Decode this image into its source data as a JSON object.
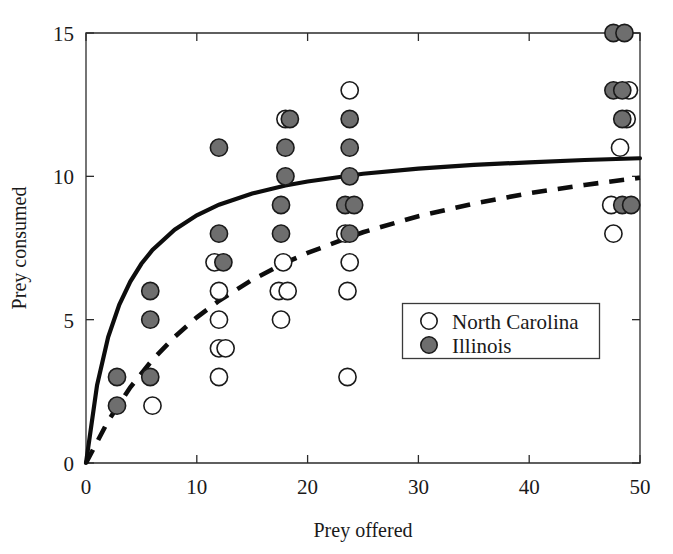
{
  "chart_data": {
    "type": "scatter",
    "title": "",
    "xlabel": "Prey offered",
    "ylabel": "Prey consumed",
    "xlim": [
      0,
      50
    ],
    "ylim": [
      0,
      15
    ],
    "xticks": [
      0,
      10,
      20,
      30,
      40,
      50
    ],
    "yticks": [
      0,
      5,
      10,
      15
    ],
    "xtick_labels": [
      "0",
      "10",
      "20",
      "30",
      "40",
      "50"
    ],
    "ytick_labels": [
      "0",
      "5",
      "10",
      "15"
    ],
    "grid": false,
    "legend_position": "lower-right-inside",
    "series": [
      {
        "name": "North Carolina",
        "marker": "open-circle",
        "marker_fill": "#ffffff",
        "marker_edge": "#1a1a1a",
        "fit_line_style": "dashed",
        "points": [
          [
            6,
            2
          ],
          [
            12,
            3
          ],
          [
            12,
            4
          ],
          [
            12.6,
            4
          ],
          [
            12,
            5
          ],
          [
            12,
            6
          ],
          [
            11.6,
            7
          ],
          [
            17.6,
            5
          ],
          [
            17.4,
            6
          ],
          [
            18.2,
            6
          ],
          [
            17.8,
            7
          ],
          [
            18,
            12
          ],
          [
            23.6,
            3
          ],
          [
            23.6,
            6
          ],
          [
            23.8,
            7
          ],
          [
            23.4,
            8
          ],
          [
            23.8,
            13
          ],
          [
            47.6,
            8
          ],
          [
            47.4,
            9
          ],
          [
            48.2,
            11
          ],
          [
            48.8,
            12
          ],
          [
            49,
            13
          ]
        ]
      },
      {
        "name": "Illinois",
        "marker": "filled-circle",
        "marker_fill": "#6e6e6e",
        "marker_edge": "#1a1a1a",
        "fit_line_style": "solid",
        "points": [
          [
            2.8,
            2
          ],
          [
            2.8,
            3
          ],
          [
            5.8,
            3
          ],
          [
            5.8,
            5
          ],
          [
            5.8,
            6
          ],
          [
            12,
            8
          ],
          [
            12,
            11
          ],
          [
            12.4,
            7
          ],
          [
            17.6,
            8
          ],
          [
            17.6,
            9
          ],
          [
            18,
            10
          ],
          [
            18,
            11
          ],
          [
            18.4,
            12
          ],
          [
            23.8,
            8
          ],
          [
            23.4,
            9
          ],
          [
            24.2,
            9
          ],
          [
            23.8,
            10
          ],
          [
            23.8,
            11
          ],
          [
            23.8,
            12
          ],
          [
            48.4,
            9
          ],
          [
            49.2,
            9
          ],
          [
            48.4,
            12
          ],
          [
            47.6,
            13
          ],
          [
            48.4,
            13
          ],
          [
            47.6,
            15
          ],
          [
            48.6,
            15
          ]
        ]
      }
    ],
    "fit_curves": [
      {
        "name": "Illinois functional response",
        "style": "solid",
        "model": "type-II (Holling disc equation)",
        "asymptote": 11.4,
        "half_saturation": 3.2,
        "sample_points": [
          [
            0,
            0
          ],
          [
            1,
            2.72
          ],
          [
            2,
            4.39
          ],
          [
            3,
            5.52
          ],
          [
            4,
            6.33
          ],
          [
            5,
            6.95
          ],
          [
            6,
            7.43
          ],
          [
            8,
            8.14
          ],
          [
            10,
            8.64
          ],
          [
            12,
            9.01
          ],
          [
            15,
            9.4
          ],
          [
            18,
            9.68
          ],
          [
            20,
            9.82
          ],
          [
            25,
            10.09
          ],
          [
            30,
            10.27
          ],
          [
            35,
            10.4
          ],
          [
            40,
            10.49
          ],
          [
            45,
            10.57
          ],
          [
            50,
            10.63
          ]
        ]
      },
      {
        "name": "North Carolina functional response",
        "style": "dashed",
        "model": "type-II (Holling disc equation)",
        "asymptote": 13.2,
        "half_saturation": 16.0,
        "sample_points": [
          [
            0,
            0
          ],
          [
            2,
            1.47
          ],
          [
            4,
            2.64
          ],
          [
            6,
            3.6
          ],
          [
            8,
            4.4
          ],
          [
            10,
            5.08
          ],
          [
            12,
            5.66
          ],
          [
            15,
            6.39
          ],
          [
            18,
            6.99
          ],
          [
            20,
            7.33
          ],
          [
            25,
            8.05
          ],
          [
            30,
            8.61
          ],
          [
            35,
            9.05
          ],
          [
            40,
            9.41
          ],
          [
            45,
            9.7
          ],
          [
            50,
            9.95
          ]
        ]
      }
    ]
  },
  "legend": {
    "entries": [
      {
        "label": "North Carolina",
        "marker": "open-circle"
      },
      {
        "label": "Illinois",
        "marker": "filled-circle"
      }
    ]
  },
  "colors": {
    "filled_marker": "#6e6e6e",
    "marker_edge": "#1a1a1a",
    "axis": "#2b2b2b",
    "curve": "#0d0d0d",
    "background": "#ffffff"
  }
}
